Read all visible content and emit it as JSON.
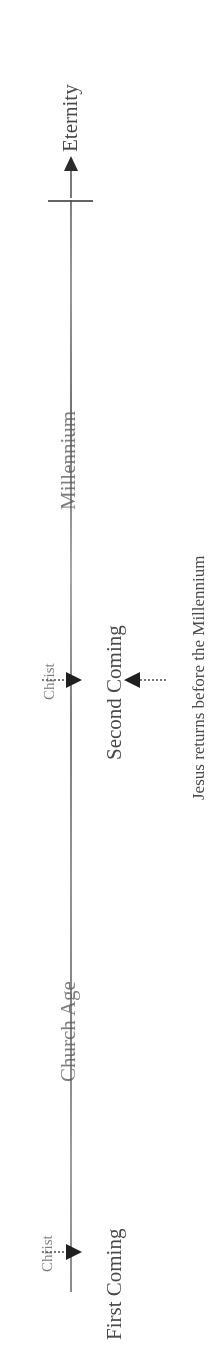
{
  "document": {
    "kind": "prophecy-timeline-diagram",
    "orientation": "rotated-90-ccw",
    "background_color": "#ffffff",
    "ink_color": "#3a3a3a"
  },
  "timeline": {
    "axis_label": "timeline-axis",
    "direction": "bottom-to-top",
    "terminus_label": "Eternity"
  },
  "events": [
    {
      "id": "first-coming",
      "marker_label": "Christ",
      "event_label": "First Coming",
      "arrow": "right"
    },
    {
      "id": "second-coming",
      "marker_label": "Christ",
      "event_label": "Second Coming",
      "arrow": "right"
    }
  ],
  "eras": [
    {
      "id": "church-age",
      "label": "Church Age"
    },
    {
      "id": "millennium",
      "label": "Millennium"
    }
  ],
  "annotations": [
    {
      "id": "premillennial-note",
      "text": "Jesus returns before the Millennium",
      "arrow": "left"
    }
  ],
  "terminus": {
    "label": "Eternity"
  }
}
